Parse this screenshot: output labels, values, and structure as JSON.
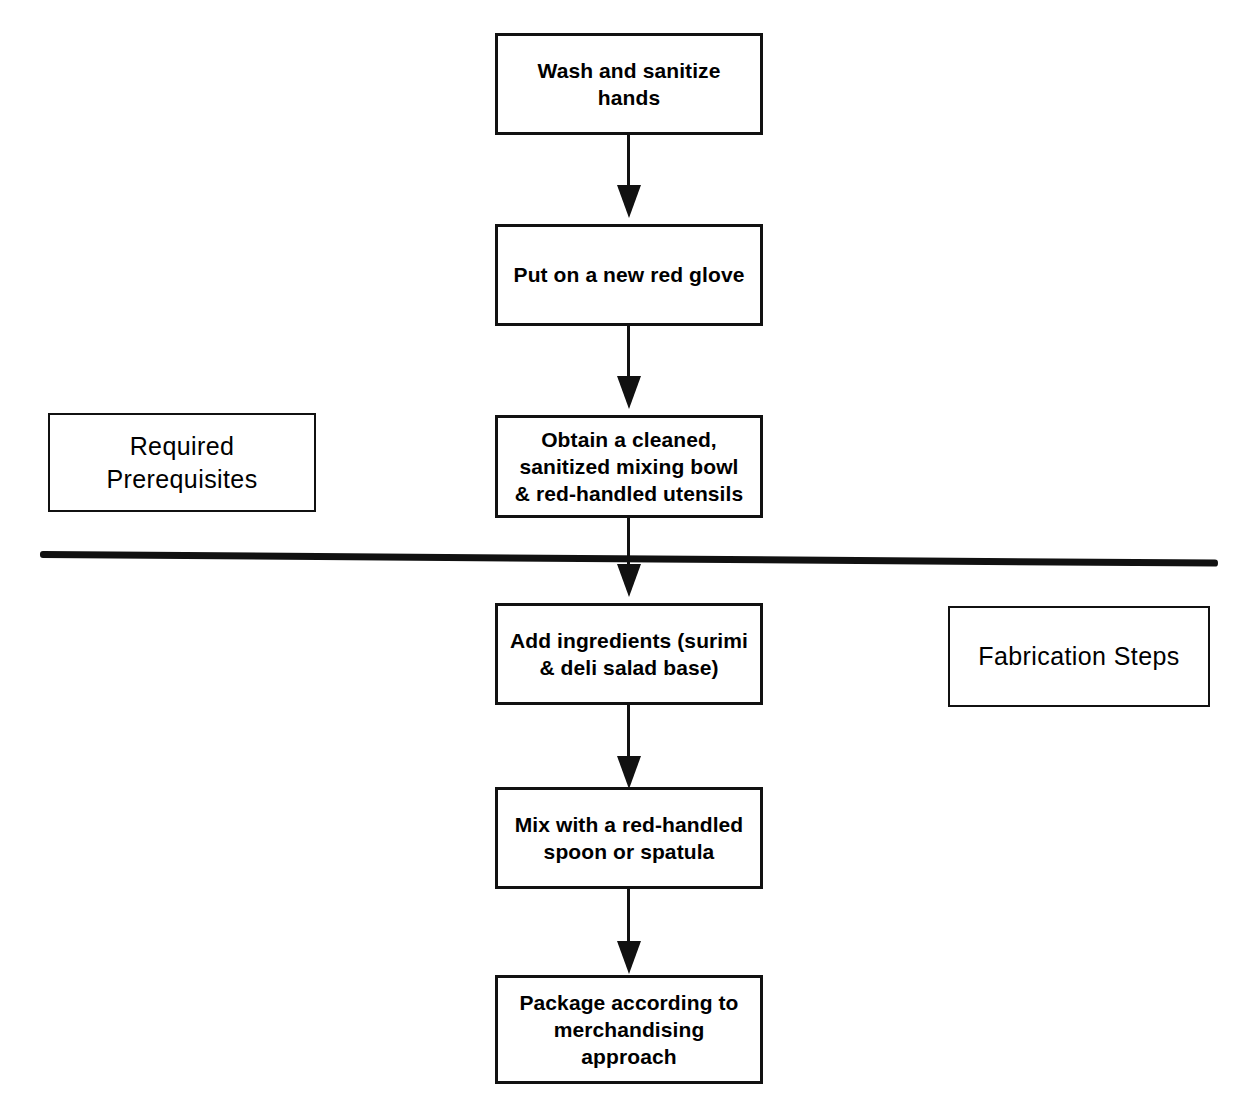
{
  "diagram": {
    "line_color": "#111111",
    "background": "#ffffff",
    "sections": [
      {
        "id": "prerequisites",
        "label": "Required\nPrerequisites"
      },
      {
        "id": "fabrication",
        "label": "Fabrication Steps"
      }
    ],
    "steps": [
      {
        "id": "step-1",
        "label": "Wash and sanitize\nhands",
        "section": "prerequisites"
      },
      {
        "id": "step-2",
        "label": "Put on a new red glove",
        "section": "prerequisites"
      },
      {
        "id": "step-3",
        "label": "Obtain a cleaned,\nsanitized mixing bowl\n& red-handled utensils",
        "section": "prerequisites"
      },
      {
        "id": "step-4",
        "label": "Add ingredients (surimi\n& deli salad base)",
        "section": "fabrication"
      },
      {
        "id": "step-5",
        "label": "Mix with a red-handled\nspoon or spatula",
        "section": "fabrication"
      },
      {
        "id": "step-6",
        "label": "Package according to\nmerchandising\napproach",
        "section": "fabrication"
      }
    ],
    "connectors": [
      {
        "id": "connector-1-2",
        "from": "step-1",
        "to": "step-2"
      },
      {
        "id": "connector-2-3",
        "from": "step-2",
        "to": "step-3"
      },
      {
        "id": "connector-3-4",
        "from": "step-3",
        "to": "step-4"
      },
      {
        "id": "connector-4-5",
        "from": "step-4",
        "to": "step-5"
      },
      {
        "id": "connector-5-6",
        "from": "step-5",
        "to": "step-6"
      }
    ],
    "divider": {
      "id": "section-divider",
      "orientation": "horizontal"
    }
  }
}
